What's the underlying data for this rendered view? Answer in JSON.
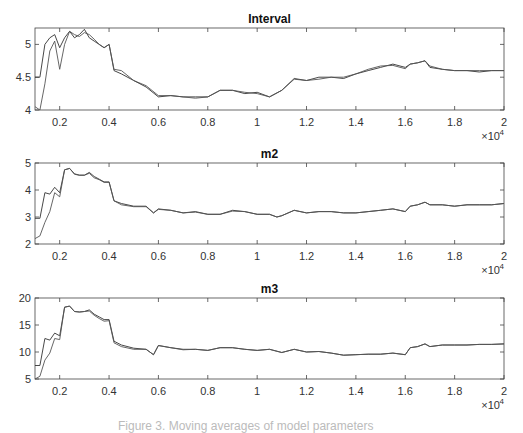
{
  "chart_data": [
    {
      "type": "line",
      "title": "Interval",
      "xlabel": "",
      "ylabel": "",
      "x_multiplier": "×10^4",
      "xlim": [
        0.1,
        2
      ],
      "ylim": [
        4,
        5.25
      ],
      "xticks": [
        "0.2",
        "0.4",
        "0.6",
        "0.8",
        "1",
        "1.2",
        "1.4",
        "1.6",
        "1.8",
        "2"
      ],
      "yticks": [
        "4",
        "4.5",
        "5"
      ],
      "grid": false,
      "x": [
        0.1,
        0.12,
        0.14,
        0.16,
        0.18,
        0.2,
        0.22,
        0.24,
        0.26,
        0.28,
        0.3,
        0.32,
        0.34,
        0.36,
        0.38,
        0.4,
        0.42,
        0.45,
        0.5,
        0.55,
        0.6,
        0.65,
        0.7,
        0.75,
        0.8,
        0.85,
        0.9,
        0.95,
        1.0,
        1.05,
        1.1,
        1.15,
        1.2,
        1.25,
        1.3,
        1.35,
        1.4,
        1.45,
        1.5,
        1.55,
        1.6,
        1.62,
        1.65,
        1.68,
        1.7,
        1.75,
        1.8,
        1.85,
        1.9,
        1.95,
        2.0
      ],
      "series": [
        {
          "name": "series1",
          "values": [
            4.5,
            4.5,
            5.0,
            5.1,
            5.15,
            4.95,
            5.1,
            5.2,
            5.1,
            5.15,
            5.23,
            5.1,
            5.05,
            5.0,
            4.95,
            5.0,
            4.6,
            4.55,
            4.45,
            4.35,
            4.2,
            4.22,
            4.2,
            4.2,
            4.2,
            4.3,
            4.3,
            4.25,
            4.27,
            4.2,
            4.3,
            4.48,
            4.45,
            4.5,
            4.5,
            4.48,
            4.55,
            4.6,
            4.65,
            4.7,
            4.65,
            4.7,
            4.72,
            4.75,
            4.65,
            4.62,
            4.6,
            4.6,
            4.58,
            4.6,
            4.6
          ]
        },
        {
          "name": "series2",
          "values": [
            4.05,
            4.0,
            4.4,
            4.9,
            5.05,
            4.62,
            5.0,
            5.2,
            5.15,
            5.12,
            5.18,
            5.15,
            5.08,
            5.0,
            4.95,
            5.0,
            4.62,
            4.6,
            4.45,
            4.37,
            4.22,
            4.22,
            4.2,
            4.18,
            4.2,
            4.3,
            4.3,
            4.27,
            4.25,
            4.2,
            4.3,
            4.47,
            4.45,
            4.47,
            4.5,
            4.5,
            4.55,
            4.62,
            4.67,
            4.68,
            4.63,
            4.7,
            4.72,
            4.75,
            4.67,
            4.62,
            4.6,
            4.6,
            4.6,
            4.6,
            4.6
          ]
        }
      ]
    },
    {
      "type": "line",
      "title": "m2",
      "xlabel": "",
      "ylabel": "",
      "x_multiplier": "×10^4",
      "xlim": [
        0.1,
        2
      ],
      "ylim": [
        2,
        5
      ],
      "xticks": [
        "0.2",
        "0.4",
        "0.6",
        "0.8",
        "1",
        "1.2",
        "1.4",
        "1.6",
        "1.8",
        "2"
      ],
      "yticks": [
        "2",
        "3",
        "4",
        "5"
      ],
      "grid": false,
      "x": [
        0.1,
        0.12,
        0.14,
        0.16,
        0.18,
        0.2,
        0.22,
        0.24,
        0.26,
        0.28,
        0.3,
        0.32,
        0.34,
        0.36,
        0.38,
        0.4,
        0.42,
        0.45,
        0.5,
        0.55,
        0.58,
        0.6,
        0.65,
        0.7,
        0.75,
        0.8,
        0.85,
        0.9,
        0.95,
        1.0,
        1.05,
        1.08,
        1.1,
        1.15,
        1.2,
        1.25,
        1.3,
        1.35,
        1.4,
        1.45,
        1.5,
        1.55,
        1.6,
        1.62,
        1.65,
        1.68,
        1.7,
        1.75,
        1.8,
        1.85,
        1.9,
        1.95,
        2.0
      ],
      "series": [
        {
          "name": "series1",
          "values": [
            2.95,
            2.95,
            3.9,
            3.85,
            4.1,
            3.9,
            4.75,
            4.8,
            4.6,
            4.55,
            4.55,
            4.65,
            4.5,
            4.4,
            4.3,
            4.3,
            3.6,
            3.5,
            3.4,
            3.4,
            3.15,
            3.3,
            3.25,
            3.15,
            3.2,
            3.1,
            3.1,
            3.25,
            3.2,
            3.1,
            3.1,
            3.0,
            3.05,
            3.25,
            3.15,
            3.2,
            3.2,
            3.15,
            3.15,
            3.2,
            3.25,
            3.3,
            3.2,
            3.4,
            3.45,
            3.55,
            3.45,
            3.45,
            3.4,
            3.45,
            3.45,
            3.45,
            3.5
          ]
        },
        {
          "name": "series2",
          "values": [
            2.2,
            2.3,
            2.8,
            3.2,
            3.9,
            3.75,
            4.75,
            4.8,
            4.58,
            4.55,
            4.55,
            4.62,
            4.45,
            4.38,
            4.28,
            4.28,
            3.6,
            3.45,
            3.38,
            3.38,
            3.15,
            3.28,
            3.25,
            3.15,
            3.18,
            3.1,
            3.1,
            3.22,
            3.2,
            3.1,
            3.1,
            3.0,
            3.05,
            3.25,
            3.15,
            3.2,
            3.2,
            3.15,
            3.15,
            3.2,
            3.25,
            3.3,
            3.2,
            3.4,
            3.45,
            3.55,
            3.45,
            3.45,
            3.4,
            3.45,
            3.45,
            3.45,
            3.5
          ]
        }
      ]
    },
    {
      "type": "line",
      "title": "m3",
      "xlabel": "",
      "ylabel": "",
      "x_multiplier": "×10^4",
      "xlim": [
        0.1,
        2
      ],
      "ylim": [
        5,
        20
      ],
      "xticks": [
        "0.2",
        "0.4",
        "0.6",
        "0.8",
        "1",
        "1.2",
        "1.4",
        "1.6",
        "1.8",
        "2"
      ],
      "yticks": [
        "5",
        "10",
        "15",
        "20"
      ],
      "grid": false,
      "x": [
        0.1,
        0.12,
        0.14,
        0.16,
        0.18,
        0.2,
        0.22,
        0.24,
        0.26,
        0.28,
        0.3,
        0.32,
        0.34,
        0.36,
        0.38,
        0.4,
        0.42,
        0.45,
        0.5,
        0.55,
        0.58,
        0.6,
        0.65,
        0.7,
        0.75,
        0.8,
        0.85,
        0.9,
        0.95,
        1.0,
        1.05,
        1.1,
        1.15,
        1.2,
        1.25,
        1.3,
        1.35,
        1.4,
        1.45,
        1.5,
        1.55,
        1.6,
        1.62,
        1.65,
        1.68,
        1.7,
        1.75,
        1.8,
        1.85,
        1.9,
        1.95,
        2.0
      ],
      "series": [
        {
          "name": "series1",
          "values": [
            7.5,
            7.5,
            12.5,
            12.2,
            13.5,
            13.0,
            18.3,
            18.5,
            17.5,
            17.4,
            17.5,
            17.8,
            17.0,
            16.5,
            16.0,
            16.0,
            12.0,
            11.3,
            10.7,
            10.5,
            9.5,
            11.2,
            10.8,
            10.5,
            10.5,
            10.3,
            10.8,
            10.8,
            10.5,
            10.3,
            10.5,
            9.9,
            10.5,
            10.0,
            10.1,
            9.8,
            9.4,
            9.5,
            9.6,
            9.6,
            9.8,
            9.5,
            10.8,
            11.0,
            11.5,
            11.0,
            11.3,
            11.3,
            11.3,
            11.4,
            11.4,
            11.5
          ]
        },
        {
          "name": "series2",
          "values": [
            5.0,
            5.5,
            8.5,
            9.8,
            12.5,
            12.3,
            18.3,
            18.5,
            17.5,
            17.4,
            17.5,
            17.6,
            16.8,
            16.2,
            15.7,
            15.8,
            11.7,
            11.0,
            10.5,
            10.5,
            9.5,
            11.2,
            10.8,
            10.4,
            10.5,
            10.3,
            10.8,
            10.8,
            10.5,
            10.3,
            10.5,
            9.9,
            10.5,
            10.0,
            10.1,
            9.8,
            9.4,
            9.5,
            9.6,
            9.6,
            9.8,
            9.5,
            10.8,
            11.0,
            11.5,
            11.0,
            11.3,
            11.3,
            11.3,
            11.4,
            11.4,
            11.5
          ]
        }
      ]
    }
  ],
  "caption": "Figure 3. Moving averages of model parameters"
}
